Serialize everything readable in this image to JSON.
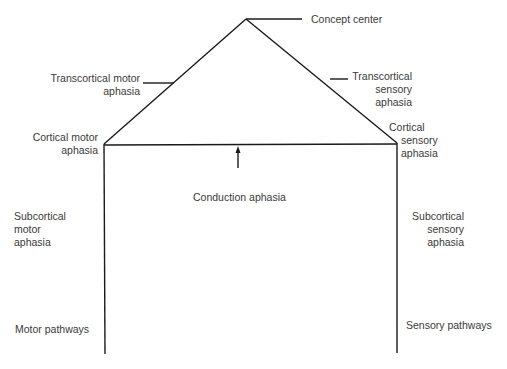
{
  "diagram": {
    "type": "aphasia-model (Lichtheim house)",
    "nodes": {
      "concept_center": "Concept center",
      "transcortical_motor": [
        "Transcortical motor",
        "aphasia"
      ],
      "transcortical_sensory": [
        "Transcortical",
        "sensory",
        "aphasia"
      ],
      "cortical_motor": [
        "Cortical motor",
        "aphasia"
      ],
      "cortical_sensory": [
        "Cortical",
        "sensory",
        "aphasia"
      ],
      "conduction": "Conduction aphasia",
      "subcortical_motor": [
        "Subcortical",
        "motor",
        "aphasia"
      ],
      "subcortical_sensory": [
        "Subcortical",
        "sensory",
        "aphasia"
      ],
      "motor_pathways": "Motor pathways",
      "sensory_pathways": "Sensory pathways"
    },
    "colors": {
      "line": "#1a1a1a",
      "text": "#3a3a3a",
      "background": "#ffffff"
    }
  }
}
